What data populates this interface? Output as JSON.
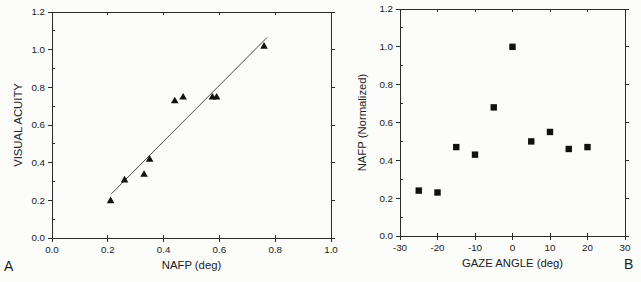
{
  "figure": {
    "background": "#fcfcfa",
    "ink_color": "#2b2b2b",
    "text_color": "#222222"
  },
  "chart_data": [
    {
      "type": "scatter",
      "panel_label": "A",
      "marker": "triangle",
      "marker_color": "#111111",
      "xlabel": "NAFP (deg)",
      "ylabel": "VISUAL ACUITY",
      "xlim": [
        0.0,
        1.0
      ],
      "ylim": [
        0.0,
        1.2
      ],
      "xticks": [
        0.0,
        0.2,
        0.4,
        0.6,
        0.8,
        1.0
      ],
      "xtick_labels": [
        "0.0",
        "0.2",
        "0.4",
        "0.6",
        "0.8",
        "1.0"
      ],
      "yticks": [
        0.0,
        0.2,
        0.4,
        0.6,
        0.8,
        1.0,
        1.2
      ],
      "ytick_labels": [
        "0.0",
        "0.2",
        "0.4",
        "0.6",
        "0.8",
        "1.0",
        "1.2"
      ],
      "grid": false,
      "legend": null,
      "points": [
        [
          0.21,
          0.2
        ],
        [
          0.26,
          0.31
        ],
        [
          0.33,
          0.34
        ],
        [
          0.35,
          0.42
        ],
        [
          0.44,
          0.73
        ],
        [
          0.47,
          0.75
        ],
        [
          0.575,
          0.75
        ],
        [
          0.59,
          0.75
        ],
        [
          0.76,
          1.02
        ]
      ],
      "fit_line": {
        "x1": 0.213,
        "y1": 0.235,
        "x2": 0.771,
        "y2": 1.065,
        "color": "#4a4a4a"
      }
    },
    {
      "type": "scatter",
      "panel_label": "B",
      "marker": "square",
      "marker_color": "#111111",
      "xlabel": "GAZE ANGLE (deg)",
      "ylabel": "NAFP (Normalized)",
      "xlim": [
        -30,
        30
      ],
      "ylim": [
        0.0,
        1.2
      ],
      "xticks": [
        -30,
        -20,
        -10,
        0,
        10,
        20,
        30
      ],
      "xtick_labels": [
        "-30",
        "-20",
        "-10",
        "0",
        "10",
        "20",
        "30"
      ],
      "yticks": [
        0.0,
        0.2,
        0.4,
        0.6,
        0.8,
        1.0,
        1.2
      ],
      "ytick_labels": [
        "0.0",
        "0.2",
        "0.4",
        "0.6",
        "0.8",
        "1.0",
        "1.2"
      ],
      "grid": false,
      "legend": null,
      "points": [
        [
          -25,
          0.24
        ],
        [
          -20,
          0.23
        ],
        [
          -15,
          0.47
        ],
        [
          -10,
          0.43
        ],
        [
          -5,
          0.68
        ],
        [
          0,
          1.0
        ],
        [
          5,
          0.5
        ],
        [
          10,
          0.55
        ],
        [
          15,
          0.46
        ],
        [
          20,
          0.47
        ]
      ],
      "fit_line": null
    }
  ]
}
